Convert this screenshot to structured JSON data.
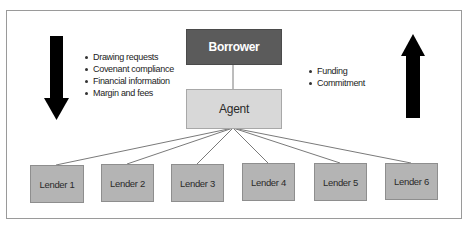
{
  "diagram": {
    "type": "syndicated-loan-structure",
    "nodes": {
      "borrower": {
        "label": "Borrower",
        "color": "#5b5b5b",
        "text_color": "#ffffff"
      },
      "agent": {
        "label": "Agent",
        "color": "#d8d8d8"
      },
      "lenders": [
        {
          "label": "Lender 1"
        },
        {
          "label": "Lender 2"
        },
        {
          "label": "Lender 3"
        },
        {
          "label": "Lender 4"
        },
        {
          "label": "Lender 5"
        },
        {
          "label": "Lender 6"
        }
      ],
      "lender_color": "#b4b4b4"
    },
    "edges": [
      {
        "from": "Borrower",
        "to": "Agent"
      },
      {
        "from": "Agent",
        "to": "Lender 1"
      },
      {
        "from": "Agent",
        "to": "Lender 2"
      },
      {
        "from": "Agent",
        "to": "Lender 3"
      },
      {
        "from": "Agent",
        "to": "Lender 4"
      },
      {
        "from": "Agent",
        "to": "Lender 5"
      },
      {
        "from": "Agent",
        "to": "Lender 6"
      }
    ],
    "left_annotation": {
      "arrow_direction": "down",
      "items": [
        "Drawing requests",
        "Covenant compliance",
        "Financial information",
        "Margin and fees"
      ]
    },
    "right_annotation": {
      "arrow_direction": "up",
      "items": [
        "Funding",
        "Commitment"
      ]
    }
  }
}
